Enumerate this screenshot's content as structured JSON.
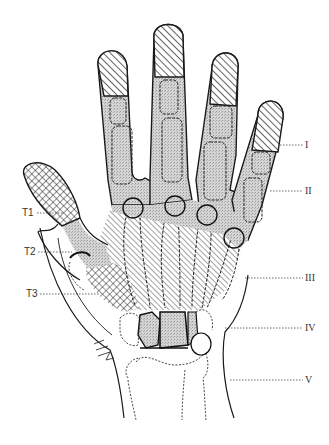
{
  "diagram": {
    "colors": {
      "outline": "#1a1a1a",
      "stipple": "#cfcfcf",
      "background": "#ffffff"
    },
    "left_labels": [
      {
        "id": "T1",
        "text": "T1"
      },
      {
        "id": "T2",
        "text": "T2"
      },
      {
        "id": "T3",
        "text": "T3"
      }
    ],
    "right_labels": [
      {
        "id": "I",
        "text": "I"
      },
      {
        "id": "II",
        "text": "II"
      },
      {
        "id": "III",
        "text": "III"
      },
      {
        "id": "IV",
        "text": "IV"
      },
      {
        "id": "V",
        "text": "V"
      }
    ]
  }
}
